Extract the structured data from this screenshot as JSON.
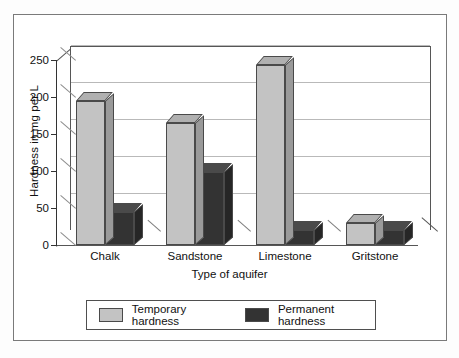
{
  "chart_data": {
    "type": "bar",
    "title": "",
    "xlabel": "Type of aquifer",
    "ylabel": "Hardness in mg per L",
    "categories": [
      "Chalk",
      "Sandstone",
      "Limestone",
      "Gritstone"
    ],
    "series": [
      {
        "name": "Temporary hardness",
        "color": "#c3c3c3",
        "values": [
          195,
          165,
          243,
          30
        ]
      },
      {
        "name": "Permanent hardness",
        "color": "#333333",
        "values": [
          45,
          98,
          20,
          20
        ]
      }
    ],
    "ylim": [
      0,
      250
    ],
    "yticks": [
      0,
      50,
      100,
      150,
      200,
      250
    ],
    "ytick_labels": [
      "0",
      "50",
      "100",
      "150",
      "200",
      "250"
    ],
    "grid": true,
    "legend_position": "bottom",
    "style": "3d-bar"
  },
  "legend": {
    "entries": [
      {
        "label": "Temporary hardness",
        "swatch": "light"
      },
      {
        "label": "Permanent hardness",
        "swatch": "dark"
      }
    ]
  }
}
